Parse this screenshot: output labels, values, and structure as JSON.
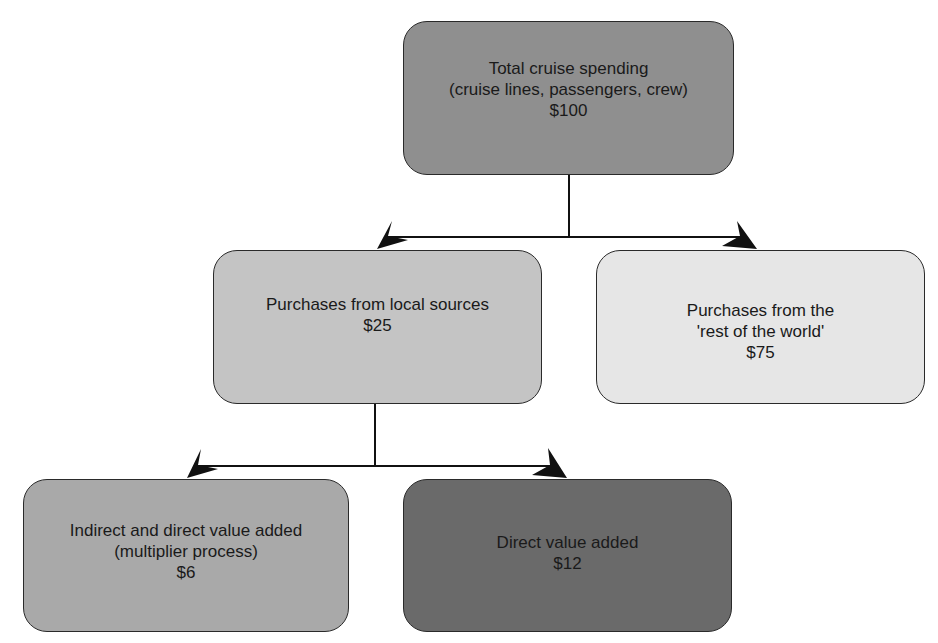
{
  "diagram": {
    "type": "flow-tree",
    "nodes": [
      {
        "id": "total",
        "lines": [
          "Total cruise spending",
          "(cruise lines, passengers, crew)",
          "$100"
        ],
        "fill": "#8f8f8f"
      },
      {
        "id": "local",
        "lines": [
          "Purchases from local sources",
          "$25"
        ],
        "fill": "#c4c4c4"
      },
      {
        "id": "row",
        "lines": [
          "Purchases from the",
          "'rest of the world'",
          "$75"
        ],
        "fill": "#e6e6e6"
      },
      {
        "id": "indirect",
        "lines": [
          "Indirect and direct value added",
          "(multiplier process)",
          "$6"
        ],
        "fill": "#a9a9a9"
      },
      {
        "id": "direct",
        "lines": [
          "Direct value added",
          "$12"
        ],
        "fill": "#6a6a6a"
      }
    ],
    "edges": [
      {
        "from": "total",
        "to": "local"
      },
      {
        "from": "total",
        "to": "row"
      },
      {
        "from": "local",
        "to": "indirect"
      },
      {
        "from": "local",
        "to": "direct"
      }
    ],
    "line_color": "#111111"
  }
}
